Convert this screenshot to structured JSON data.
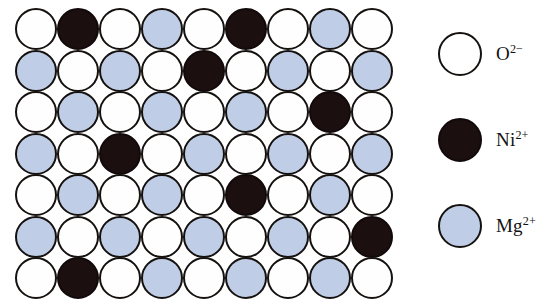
{
  "figure": {
    "name": "mgo-nio-solid-solution-lattice"
  },
  "colors": {
    "oxide": "#ffffff",
    "nickel": "#1b0f10",
    "magnesium": "#bfcee6",
    "outline": "#15110f",
    "background": "#ffffff"
  },
  "lattice": {
    "rows": 7,
    "columns": 9,
    "ion_codes": {
      "O": "oxide",
      "N": "nickel",
      "M": "magnesium"
    },
    "grid": [
      [
        "O",
        "N",
        "O",
        "M",
        "O",
        "N",
        "O",
        "M",
        "O"
      ],
      [
        "M",
        "O",
        "M",
        "O",
        "N",
        "O",
        "M",
        "O",
        "M"
      ],
      [
        "O",
        "M",
        "O",
        "M",
        "O",
        "M",
        "O",
        "N",
        "O"
      ],
      [
        "M",
        "O",
        "N",
        "O",
        "M",
        "O",
        "M",
        "O",
        "M"
      ],
      [
        "O",
        "M",
        "O",
        "M",
        "O",
        "N",
        "O",
        "M",
        "O"
      ],
      [
        "M",
        "O",
        "M",
        "O",
        "M",
        "O",
        "M",
        "O",
        "N"
      ],
      [
        "O",
        "N",
        "O",
        "M",
        "O",
        "M",
        "O",
        "M",
        "O"
      ]
    ]
  },
  "legend": {
    "items": [
      {
        "species": "oxide",
        "symbol": "O",
        "charge": "2−",
        "label": "O2−"
      },
      {
        "species": "nickel",
        "symbol": "Ni",
        "charge": "2+",
        "label": "Ni2+"
      },
      {
        "species": "magnesium",
        "symbol": "Mg",
        "charge": "2+",
        "label": "Mg2+"
      }
    ]
  }
}
